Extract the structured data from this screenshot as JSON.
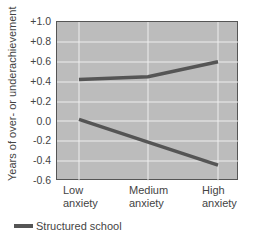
{
  "chart_data": {
    "type": "line",
    "title": "",
    "xlabel": "",
    "ylabel": "Years of over- or underachievement",
    "categories": [
      "Low anxiety",
      "Medium anxiety",
      "High anxiety"
    ],
    "category_lines": [
      [
        "Low",
        "anxiety"
      ],
      [
        "Medium",
        "anxiety"
      ],
      [
        "High",
        "anxiety"
      ]
    ],
    "yticks": [
      "+1.0",
      "+0.8",
      "+0.6",
      "+0.4",
      "+0.2",
      "0.0",
      "-0.2",
      "-0.4",
      "-0.6"
    ],
    "ylim": [
      -0.6,
      1.0
    ],
    "grid": true,
    "series": [
      {
        "name": "Structured school",
        "values": [
          0.42,
          0.45,
          0.6
        ],
        "color": "#555555"
      },
      {
        "name": "(unlabeled series)",
        "values": [
          0.02,
          -0.21,
          -0.44
        ],
        "color": "#555555"
      }
    ],
    "legend": {
      "position": "bottom-left",
      "entries": [
        "Structured school"
      ]
    }
  }
}
